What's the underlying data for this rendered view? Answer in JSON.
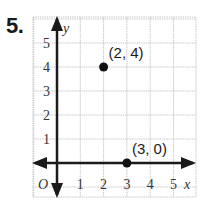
{
  "problem": {
    "number": "5."
  },
  "chart_data": {
    "type": "scatter",
    "title": "",
    "xlabel": "x",
    "ylabel": "y",
    "origin_label": "O",
    "xlim": [
      -1,
      6
    ],
    "ylim": [
      -1,
      6
    ],
    "x_ticks": [
      "1",
      "2",
      "3",
      "4",
      "5"
    ],
    "y_ticks": [
      "1",
      "2",
      "3",
      "4",
      "5"
    ],
    "grid": true,
    "points": [
      {
        "x": 2,
        "y": 4,
        "label": "(2, 4)"
      },
      {
        "x": 3,
        "y": 0,
        "label": "(3, 0)"
      }
    ]
  },
  "colors": {
    "grid": "#c8c8c8",
    "axis": "#1a1a1a",
    "point": "#111111"
  }
}
